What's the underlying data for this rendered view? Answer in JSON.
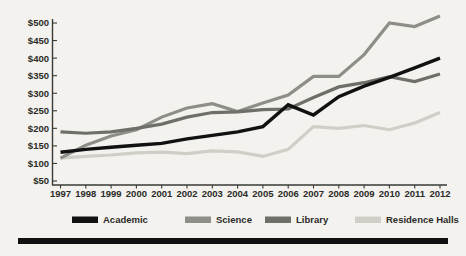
{
  "figure": {
    "background_color": "#f3f2ee",
    "footer_rule_color": "#111111"
  },
  "axis": {
    "y_tick_labels": [
      "$500",
      "$450",
      "$400",
      "$350",
      "$300",
      "$250",
      "$200",
      "$150",
      "$100",
      "$50"
    ],
    "x_tick_labels": [
      "1997",
      "1998",
      "1999",
      "2000",
      "2001",
      "2002",
      "2003",
      "2004",
      "2005",
      "2006",
      "2007",
      "2008",
      "2009",
      "2010",
      "2011",
      "2012"
    ]
  },
  "legend": {
    "items": [
      {
        "label": "Academic",
        "color": "#111111"
      },
      {
        "label": "Science",
        "color": "#8e8e88"
      },
      {
        "label": "Library",
        "color": "#6f6f6a"
      },
      {
        "label": "Residence Halls",
        "color": "#cfcfc7"
      }
    ]
  },
  "chart_data": {
    "type": "line",
    "title": "",
    "xlabel": "",
    "ylabel": "",
    "ylim": [
      50,
      500
    ],
    "xlim": [
      "1997",
      "2012"
    ],
    "grid": false,
    "legend_position": "bottom",
    "x": [
      1997,
      1998,
      1999,
      2000,
      2001,
      2002,
      2003,
      2004,
      2005,
      2006,
      2007,
      2008,
      2009,
      2010,
      2011,
      2012
    ],
    "series": [
      {
        "name": "Academic",
        "color": "#111111",
        "values": [
          132,
          140,
          146,
          152,
          157,
          170,
          180,
          190,
          205,
          267,
          238,
          290,
          320,
          345,
          372,
          400
        ]
      },
      {
        "name": "Science",
        "color": "#8e8e88",
        "values": [
          115,
          150,
          178,
          195,
          230,
          255,
          270,
          245,
          250,
          255,
          260,
          265,
          268,
          270,
          272,
          275
        ]
      },
      {
        "name": "Library",
        "color": "#6f6f6a",
        "values": [
          190,
          185,
          190,
          198,
          225,
          250,
          245,
          248,
          255,
          253,
          255,
          258,
          260,
          262,
          264,
          266
        ]
      },
      {
        "name": "Residence Halls",
        "color": "#cfcfc7",
        "values": [
          115,
          120,
          125,
          130,
          132,
          128,
          135,
          132,
          118,
          140,
          205,
          200,
          207,
          196,
          215,
          245
        ]
      }
    ],
    "series_render": [
      {
        "name": "Academic",
        "color": "#111111",
        "width": 3.4,
        "values": [
          132,
          140,
          146,
          152,
          157,
          170,
          180,
          190,
          205,
          267,
          238,
          290,
          320,
          345,
          372,
          400
        ]
      },
      {
        "name": "Science",
        "color": "#8e8e88",
        "width": 3.2,
        "values": [
          115,
          152,
          178,
          196,
          232,
          258,
          270,
          248,
          272,
          295,
          348,
          348,
          410,
          500,
          490,
          520
        ]
      },
      {
        "name": "Library",
        "color": "#6f6f6a",
        "width": 3.2,
        "values": [
          190,
          186,
          190,
          200,
          212,
          232,
          245,
          247,
          253,
          255,
          288,
          318,
          330,
          347,
          333,
          355
        ]
      },
      {
        "name": "Residence Halls",
        "color": "#cfcfc7",
        "width": 3.2,
        "values": [
          115,
          120,
          124,
          130,
          132,
          128,
          136,
          133,
          120,
          140,
          205,
          200,
          208,
          196,
          215,
          245
        ]
      }
    ]
  }
}
